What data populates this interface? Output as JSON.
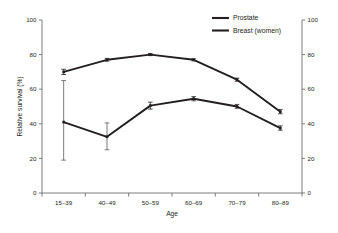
{
  "chart_data": {
    "type": "line",
    "title": "",
    "xlabel": "Age",
    "ylabel": "Relative survival (%)",
    "ylabel_right": "",
    "categories": [
      "15–39",
      "40–49",
      "50–59",
      "60–69",
      "70–79",
      "80–89"
    ],
    "ylim": [
      0,
      100
    ],
    "yticks": [
      0,
      20,
      40,
      60,
      80,
      100
    ],
    "yticks_right": [
      0,
      20,
      40,
      60,
      80,
      100
    ],
    "grid": false,
    "legend_position": "top-right",
    "series": [
      {
        "name": "Prostate",
        "color": "#231f20",
        "values": [
          70.0,
          77.0,
          80.0,
          77.0,
          65.5,
          47.0
        ],
        "err_low": [
          68.5,
          76.2,
          79.4,
          76.4,
          64.6,
          45.8
        ],
        "err_high": [
          71.5,
          77.8,
          80.6,
          77.6,
          66.4,
          48.2
        ]
      },
      {
        "name": "Breast (women)",
        "color": "#231f20",
        "values": [
          41.0,
          32.5,
          50.5,
          54.5,
          50.0,
          37.5
        ],
        "err_low": [
          19.0,
          25.0,
          48.5,
          53.3,
          49.0,
          36.3
        ],
        "err_high": [
          65.0,
          40.5,
          52.5,
          55.7,
          51.2,
          38.8
        ]
      }
    ]
  },
  "legend": {
    "items": [
      {
        "label": "Prostate"
      },
      {
        "label": "Breast (women)"
      }
    ]
  },
  "axes": {
    "y_left_label": "Relative survival (%)",
    "y_left_ticks": [
      "100",
      "80",
      "60",
      "40",
      "20",
      "0"
    ],
    "y_right_ticks": [
      "100",
      "80",
      "60",
      "40",
      "20",
      "0"
    ],
    "x_label": "Age",
    "x_ticks": [
      "15–39",
      "40–49",
      "50–59",
      "60–69",
      "70–79",
      "80–89"
    ]
  }
}
